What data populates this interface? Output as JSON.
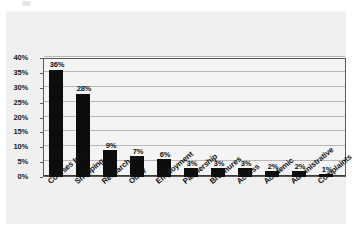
{
  "chart_data": {
    "type": "bar",
    "title": "",
    "subtitle": "",
    "xlabel": "",
    "ylabel": "",
    "categories": [
      "Courses Info",
      "Shopping",
      "Research",
      "Other",
      "Employment",
      "Partnership",
      "Brochures",
      "Access",
      "Academic",
      "Administrative",
      "Complaints"
    ],
    "values": [
      36,
      28,
      9,
      7,
      6,
      3,
      3,
      3,
      2,
      2,
      1
    ],
    "value_labels": [
      "36%",
      "28%",
      "9%",
      "7%",
      "6%",
      "3%",
      "3%",
      "3%",
      "2%",
      "2%",
      "1%"
    ],
    "ylim": [
      0,
      40
    ],
    "ytick_values": [
      40,
      35,
      30,
      25,
      20,
      15,
      10,
      5,
      0
    ],
    "ytick_labels": [
      "40%",
      "35%",
      "30%",
      "25%",
      "20%",
      "15%",
      "10%",
      "5%",
      "0%"
    ],
    "grid": true,
    "grid_axis": "y",
    "legend": false,
    "legend_position": "none",
    "units": "percent",
    "bar_color": "#0d0d0d",
    "plot_background_color": "#f4f4f4",
    "panel_background_color": "#f0f0f0",
    "gridline_color": "#b8b8b8",
    "frame_color": "#5a5a5a",
    "text_color": "#111111"
  }
}
